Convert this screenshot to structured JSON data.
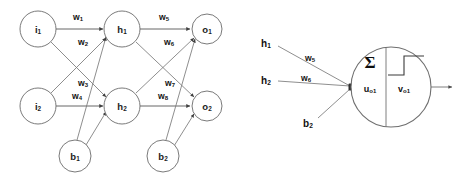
{
  "figure": {
    "background_color": "#ffffff",
    "stroke_color": "#6f6f6f",
    "text_color": "#111111"
  },
  "left_panel": {
    "name": "feedforward-network",
    "nodes": [
      {
        "id": "i1",
        "base": "i",
        "sub": "1",
        "cx": 38,
        "cy": 29,
        "r": 18,
        "layer": "input"
      },
      {
        "id": "i2",
        "base": "i",
        "sub": "2",
        "cx": 38,
        "cy": 106,
        "r": 18,
        "layer": "input"
      },
      {
        "id": "h1",
        "base": "h",
        "sub": "1",
        "cx": 122,
        "cy": 29,
        "r": 18,
        "layer": "hidden"
      },
      {
        "id": "h2",
        "base": "h",
        "sub": "2",
        "cx": 122,
        "cy": 106,
        "r": 18,
        "layer": "hidden"
      },
      {
        "id": "o1",
        "base": "o",
        "sub": "1",
        "cx": 207,
        "cy": 29,
        "r": 15,
        "layer": "output"
      },
      {
        "id": "o2",
        "base": "o",
        "sub": "2",
        "cx": 207,
        "cy": 106,
        "r": 15,
        "layer": "output"
      },
      {
        "id": "b1",
        "base": "b",
        "sub": "1",
        "cx": 75,
        "cy": 156,
        "r": 16,
        "layer": "bias"
      },
      {
        "id": "b2",
        "base": "b",
        "sub": "2",
        "cx": 163,
        "cy": 156,
        "r": 16,
        "layer": "bias"
      }
    ],
    "weights": [
      {
        "id": "w1",
        "base": "w",
        "sub": "1",
        "x": 78,
        "y": 17,
        "from": "i1",
        "to": "h1"
      },
      {
        "id": "w2",
        "base": "w",
        "sub": "2",
        "x": 83,
        "y": 42,
        "from": "i1",
        "to": "h2"
      },
      {
        "id": "w3",
        "base": "w",
        "sub": "3",
        "x": 83,
        "y": 83,
        "from": "i2",
        "to": "h1"
      },
      {
        "id": "w4",
        "base": "w",
        "sub": "4",
        "x": 77,
        "y": 96,
        "from": "i2",
        "to": "h2"
      },
      {
        "id": "w5",
        "base": "w",
        "sub": "5",
        "x": 164,
        "y": 17,
        "from": "h1",
        "to": "o1"
      },
      {
        "id": "w6",
        "base": "w",
        "sub": "6",
        "x": 169,
        "y": 42,
        "from": "h1",
        "to": "o2"
      },
      {
        "id": "w7",
        "base": "w",
        "sub": "7",
        "x": 170,
        "y": 83,
        "from": "h2",
        "to": "o1"
      },
      {
        "id": "w8",
        "base": "w",
        "sub": "8",
        "x": 163,
        "y": 96,
        "from": "h2",
        "to": "o2"
      }
    ],
    "edges": [
      {
        "from": "i1",
        "to": "h1"
      },
      {
        "from": "i1",
        "to": "h2"
      },
      {
        "from": "i2",
        "to": "h1"
      },
      {
        "from": "i2",
        "to": "h2"
      },
      {
        "from": "h1",
        "to": "o1"
      },
      {
        "from": "h1",
        "to": "o2"
      },
      {
        "from": "h2",
        "to": "o1"
      },
      {
        "from": "h2",
        "to": "o2"
      },
      {
        "from": "b1",
        "to": "h1"
      },
      {
        "from": "b1",
        "to": "h2"
      },
      {
        "from": "b2",
        "to": "o1"
      },
      {
        "from": "b2",
        "to": "o2"
      }
    ]
  },
  "right_panel": {
    "name": "single-neuron-detail",
    "neuron": {
      "cx": 391,
      "cy": 87,
      "r": 40,
      "sum_symbol": "Σ",
      "pre_activation": {
        "base": "u",
        "sub": "o1",
        "x": 370,
        "y": 89
      },
      "post_activation": {
        "base": "v",
        "sub": "o1",
        "x": 404,
        "y": 89
      },
      "activation_type": "step"
    },
    "inputs": [
      {
        "id": "h1",
        "base": "h",
        "sub": "1",
        "x": 266,
        "y": 43,
        "line_from_x": 278,
        "line_from_y": 46
      },
      {
        "id": "h2",
        "base": "h",
        "sub": "2",
        "x": 266,
        "y": 80,
        "line_from_x": 278,
        "line_from_y": 81
      },
      {
        "id": "b2",
        "base": "b",
        "sub": "2",
        "x": 308,
        "y": 123,
        "line_from_x": 318,
        "line_from_y": 118
      }
    ],
    "input_weights": [
      {
        "id": "w5",
        "base": "w",
        "sub": "5",
        "x": 310,
        "y": 58
      },
      {
        "id": "w6",
        "base": "w",
        "sub": "6",
        "x": 306,
        "y": 78
      }
    ],
    "junction": {
      "x": 351,
      "y": 87
    },
    "output_arrow": {
      "from_x": 431,
      "to_x": 453,
      "y": 87
    }
  }
}
